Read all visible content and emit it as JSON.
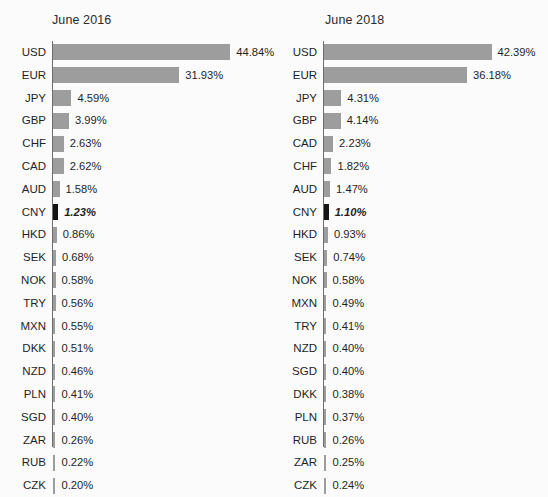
{
  "figure": {
    "background_color": "#fbfbfb",
    "bar_color": "#9d9d9d",
    "highlight_color": "#141414",
    "axis_color": "#6e6e6e",
    "value_suffix": "%"
  },
  "chart_data": [
    {
      "type": "bar",
      "orientation": "horizontal",
      "title": "June 2016",
      "xlabel": "",
      "ylabel": "",
      "xlim": [
        0,
        44.84
      ],
      "grid": false,
      "legend": "none",
      "highlight_category": "CNY",
      "categories": [
        "USD",
        "EUR",
        "JPY",
        "GBP",
        "CHF",
        "CAD",
        "AUD",
        "CNY",
        "HKD",
        "SEK",
        "NOK",
        "TRY",
        "MXN",
        "DKK",
        "NZD",
        "PLN",
        "SGD",
        "ZAR",
        "RUB",
        "CZK"
      ],
      "values": [
        44.84,
        31.93,
        4.59,
        3.99,
        2.63,
        2.62,
        1.58,
        1.23,
        0.86,
        0.68,
        0.58,
        0.56,
        0.55,
        0.51,
        0.46,
        0.41,
        0.4,
        0.26,
        0.22,
        0.2
      ],
      "data_labels": [
        "44.84%",
        "31.93%",
        "4.59%",
        "3.99%",
        "2.63%",
        "2.62%",
        "1.58%",
        "1.23%",
        "0.86%",
        "0.68%",
        "0.58%",
        "0.56%",
        "0.55%",
        "0.51%",
        "0.46%",
        "0.41%",
        "0.40%",
        "0.26%",
        "0.22%",
        "0.20%"
      ]
    },
    {
      "type": "bar",
      "orientation": "horizontal",
      "title": "June 2018",
      "xlabel": "",
      "ylabel": "",
      "xlim": [
        0,
        44.84
      ],
      "grid": false,
      "legend": "none",
      "highlight_category": "CNY",
      "categories": [
        "USD",
        "EUR",
        "JPY",
        "GBP",
        "CAD",
        "CHF",
        "AUD",
        "CNY",
        "HKD",
        "SEK",
        "NOK",
        "MXN",
        "TRY",
        "NZD",
        "SGD",
        "DKK",
        "PLN",
        "RUB",
        "ZAR",
        "CZK"
      ],
      "values": [
        42.39,
        36.18,
        4.31,
        4.14,
        2.23,
        1.82,
        1.47,
        1.1,
        0.93,
        0.74,
        0.58,
        0.49,
        0.41,
        0.4,
        0.4,
        0.38,
        0.37,
        0.26,
        0.25,
        0.24
      ],
      "data_labels": [
        "42.39%",
        "36.18%",
        "4.31%",
        "4.14%",
        "2.23%",
        "1.82%",
        "1.47%",
        "1.10%",
        "0.93%",
        "0.74%",
        "0.58%",
        "0.49%",
        "0.41%",
        "0.40%",
        "0.40%",
        "0.38%",
        "0.37%",
        "0.26%",
        "0.25%",
        "0.24%"
      ]
    }
  ]
}
